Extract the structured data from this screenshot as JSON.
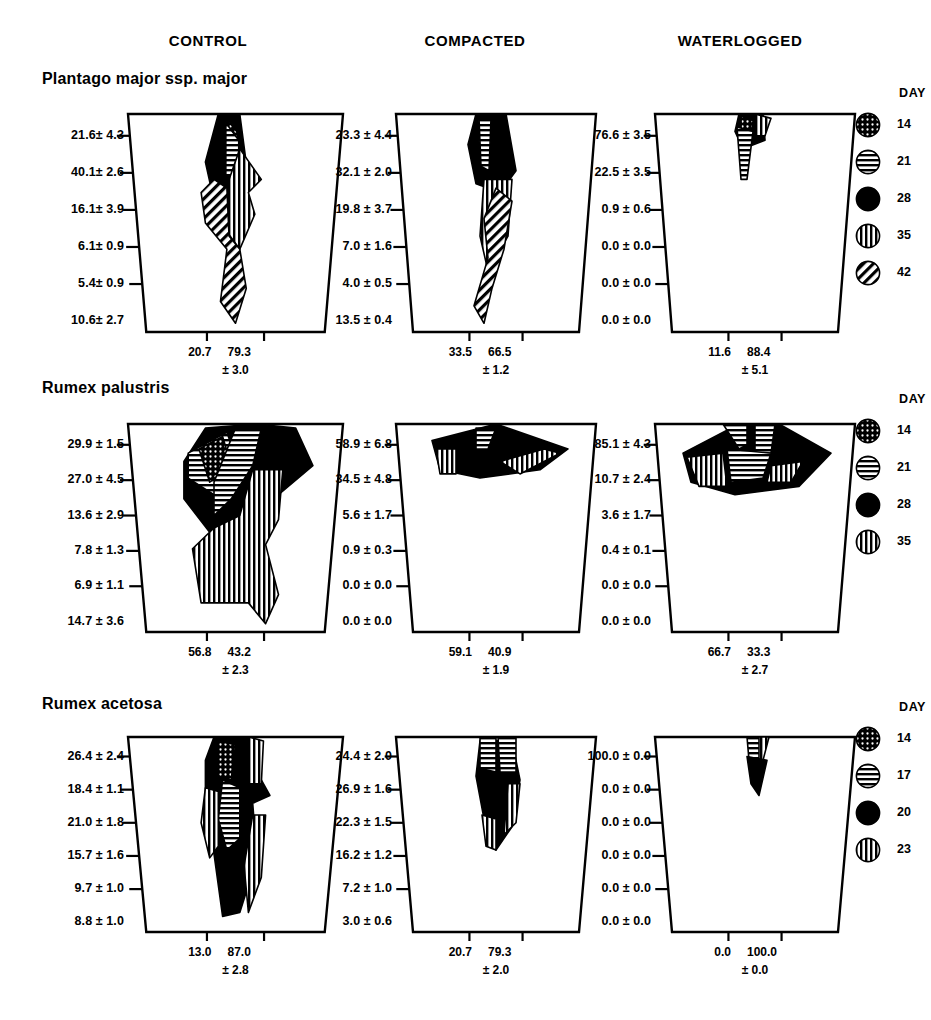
{
  "headers": {
    "control": "CONTROL",
    "compacted": "COMPACTED",
    "waterlogged": "WATERLOGGED",
    "day": "DAY"
  },
  "chart_data": {
    "type": "area",
    "xlabel": "",
    "ylabel": "",
    "grid": false,
    "legend_position": "right",
    "columns": [
      "CONTROL",
      "COMPACTED",
      "WATERLOGGED"
    ],
    "rows": [
      {
        "species": "Plantago major ssp. major",
        "legend_title": "DAY",
        "legend": [
          {
            "label": "14",
            "pattern": "dotted"
          },
          {
            "label": "21",
            "pattern": "horizontal"
          },
          {
            "label": "28",
            "pattern": "solid"
          },
          {
            "label": "35",
            "pattern": "vertical"
          },
          {
            "label": "42",
            "pattern": "diagonal"
          }
        ],
        "panels": [
          {
            "treatment": "CONTROL",
            "depth_values": [
              "21.6± 4.3",
              "40.1± 2.6",
              "16.1± 3.9",
              "6.1± 0.9",
              "5.4± 0.9",
              "10.6± 2.7"
            ],
            "bottom_left": "20.7",
            "bottom_right": "79.3",
            "bottom_sd": "± 3.0"
          },
          {
            "treatment": "COMPACTED",
            "depth_values": [
              "23.3 ± 4.4",
              "32.1 ± 2.0",
              "19.8 ± 3.7",
              "7.0 ± 1.6",
              "4.0 ± 0.5",
              "13.5 ± 0.4"
            ],
            "bottom_left": "33.5",
            "bottom_right": "66.5",
            "bottom_sd": "± 1.2"
          },
          {
            "treatment": "WATERLOGGED",
            "depth_values": [
              "76.6 ± 3.5",
              "22.5 ± 3.5",
              "0.9 ± 0.6",
              "0.0 ± 0.0",
              "0.0 ± 0.0",
              "0.0 ± 0.0"
            ],
            "bottom_left": "11.6",
            "bottom_right": "88.4",
            "bottom_sd": "± 5.1"
          }
        ]
      },
      {
        "species": "Rumex palustris",
        "legend_title": "DAY",
        "legend": [
          {
            "label": "14",
            "pattern": "dotted"
          },
          {
            "label": "21",
            "pattern": "horizontal"
          },
          {
            "label": "28",
            "pattern": "solid"
          },
          {
            "label": "35",
            "pattern": "vertical"
          }
        ],
        "panels": [
          {
            "treatment": "CONTROL",
            "depth_values": [
              "29.9 ± 1.5",
              "27.0 ± 4.5",
              "13.6 ± 2.9",
              "7.8 ± 1.3",
              "6.9 ± 1.1",
              "14.7 ± 3.6"
            ],
            "bottom_left": "56.8",
            "bottom_right": "43.2",
            "bottom_sd": "± 2.3"
          },
          {
            "treatment": "COMPACTED",
            "depth_values": [
              "58.9 ± 6.8",
              "34.5 ± 4.8",
              "5.6 ± 1.7",
              "0.9 ± 0.3",
              "0.0 ± 0.0",
              "0.0 ± 0.0"
            ],
            "bottom_left": "59.1",
            "bottom_right": "40.9",
            "bottom_sd": "± 1.9"
          },
          {
            "treatment": "WATERLOGGED",
            "depth_values": [
              "85.1 ± 4.3",
              "10.7 ± 2.4",
              "3.6 ± 1.7",
              "0.4 ± 0.1",
              "0.0 ± 0.0",
              "0.0 ± 0.0"
            ],
            "bottom_left": "66.7",
            "bottom_right": "33.3",
            "bottom_sd": "± 2.7"
          }
        ]
      },
      {
        "species": "Rumex acetosa",
        "legend_title": "DAY",
        "legend": [
          {
            "label": "14",
            "pattern": "dotted"
          },
          {
            "label": "17",
            "pattern": "horizontal"
          },
          {
            "label": "20",
            "pattern": "solid"
          },
          {
            "label": "23",
            "pattern": "vertical"
          }
        ],
        "panels": [
          {
            "treatment": "CONTROL",
            "depth_values": [
              "26.4 ± 2.4",
              "18.4 ± 1.1",
              "21.0 ± 1.8",
              "15.7 ± 1.6",
              "9.7 ± 1.0",
              "8.8 ± 1.0"
            ],
            "bottom_left": "13.0",
            "bottom_right": "87.0",
            "bottom_sd": "± 2.8"
          },
          {
            "treatment": "COMPACTED",
            "depth_values": [
              "24.4 ± 2.0",
              "26.9 ± 1.6",
              "22.3 ± 1.5",
              "16.2 ± 1.2",
              "7.2 ± 1.0",
              "3.0 ± 0.6"
            ],
            "bottom_left": "20.7",
            "bottom_right": "79.3",
            "bottom_sd": "± 2.0"
          },
          {
            "treatment": "WATERLOGGED",
            "depth_values": [
              "100.0 ± 0.0",
              "0.0 ± 0.0",
              "0.0 ± 0.0",
              "0.0 ± 0.0",
              "0.0 ± 0.0",
              "0.0 ± 0.0"
            ],
            "bottom_left": "0.0",
            "bottom_right": "100.0",
            "bottom_sd": "± 0.0"
          }
        ]
      }
    ]
  },
  "colors": {
    "ink": "#000000",
    "background": "#ffffff"
  }
}
